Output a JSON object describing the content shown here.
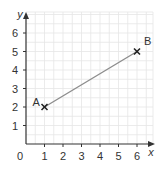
{
  "chart_data": {
    "type": "line",
    "title": "",
    "xlabel": "x",
    "ylabel": "y",
    "xlim": [
      0,
      6
    ],
    "ylim": [
      0,
      6
    ],
    "x_ticks": [
      "1",
      "2",
      "3",
      "4",
      "5",
      "6"
    ],
    "y_ticks": [
      "1",
      "2",
      "3",
      "4",
      "5",
      "6"
    ],
    "origin_label": "0",
    "grid": true,
    "series": [
      {
        "name": "AB",
        "points": [
          {
            "label": "A",
            "x": 1,
            "y": 2
          },
          {
            "label": "B",
            "x": 6,
            "y": 5
          }
        ]
      }
    ],
    "colors": {
      "line": "#8c8c8c",
      "axis": "#333333",
      "grid": "#e6e6e6",
      "marker": "#222222"
    }
  }
}
